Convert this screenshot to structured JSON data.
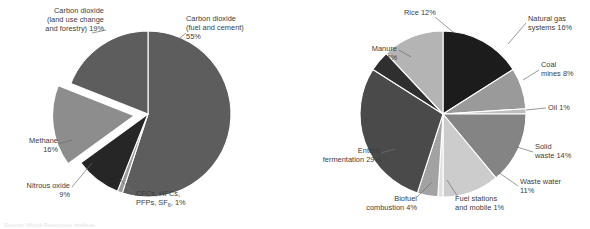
{
  "figure": {
    "background_color": "#ffffff",
    "text_color": "#3c3c3c",
    "leader_line_color": "#6e6e6e",
    "slice_gap_color": "#ffffff",
    "caption_fragment": "Source: World Resources Institute"
  },
  "chart_data": [
    {
      "type": "pie",
      "title": "",
      "id": "global-greenhouse-gas-emissions",
      "categories": [
        "Carbon dioxide (fuel and cement)",
        "CFCs, HFCs, PFPs, SF6",
        "Nitrous oxide",
        "Methane",
        "Carbon dioxide (land use change and forestry)"
      ],
      "values": [
        55,
        1,
        9,
        16,
        19
      ],
      "units": "percent",
      "legend": "none",
      "start_angle_deg": 0,
      "exploded_slices": [
        "Methane"
      ],
      "slices": [
        {
          "name": "Carbon dioxide (fuel and cement)",
          "label": "Carbon dioxide\n(fuel and cement)\n55%",
          "value": 55,
          "color": "#5d5d5d",
          "exploded": false
        },
        {
          "name": "CFCs, HFCs, PFPs, SF6",
          "label": "CFCs, HFCs,\nPFPs, SF6, 1%",
          "value": 1,
          "color": "#9b9b9b",
          "exploded": false
        },
        {
          "name": "Nitrous oxide",
          "label": "Nitrous oxide\n9%",
          "value": 9,
          "color": "#262626",
          "exploded": false
        },
        {
          "name": "Methane",
          "label": "Methane\n16%",
          "value": 16,
          "color": "#8d8d8d",
          "exploded": true
        },
        {
          "name": "Carbon dioxide (land use change and forestry)",
          "label": "Carbon dioxide\n(land use change\nand forestry) 19%",
          "value": 19,
          "color": "#5d5d5d",
          "exploded": false
        }
      ]
    },
    {
      "type": "pie",
      "title": "",
      "id": "methane-emissions-by-source",
      "categories": [
        "Natural gas systems",
        "Coal mines",
        "Oil",
        "Solid waste",
        "Waste water",
        "Fuel stations and mobile",
        "Biofuel combustion",
        "Enteric fermentation",
        "Manure",
        "Rice"
      ],
      "values": [
        16,
        8,
        1,
        14,
        11,
        1,
        4,
        29,
        4,
        12
      ],
      "units": "percent",
      "legend": "none",
      "start_angle_deg": 0,
      "exploded_slices": [],
      "slices": [
        {
          "name": "Natural gas systems",
          "label": "Natural gas\nsystems 16%",
          "value": 16,
          "color": "#1c1c1c",
          "exploded": false
        },
        {
          "name": "Coal mines",
          "label": "Coal\nmines 8%",
          "value": 8,
          "color": "#9a9a9a",
          "exploded": false
        },
        {
          "name": "Oil",
          "label": "Oil 1%",
          "value": 1,
          "color": "#bdbdbd",
          "exploded": false
        },
        {
          "name": "Solid waste",
          "label": "Solid\nwaste 14%",
          "value": 14,
          "color": "#848484",
          "exploded": false
        },
        {
          "name": "Waste water",
          "label": "Waste water\n11%",
          "value": 11,
          "color": "#cccccc",
          "exploded": false
        },
        {
          "name": "Fuel stations and mobile",
          "label": "Fuel stations\nand mobile 1%",
          "value": 1,
          "color": "#e0e0e0",
          "exploded": false
        },
        {
          "name": "Biofuel combustion",
          "label": "Biofuel\ncombustion 4%",
          "value": 4,
          "color": "#a2a2a2",
          "exploded": false
        },
        {
          "name": "Enteric fermentation",
          "label": "Enteric\nfermentation 29%",
          "value": 29,
          "color": "#4a4a4a",
          "exploded": false
        },
        {
          "name": "Manure",
          "label": "Manure\n4%",
          "value": 4,
          "color": "#2f2f2f",
          "exploded": false
        },
        {
          "name": "Rice",
          "label": "Rice 12%",
          "value": 12,
          "color": "#b4b4b4",
          "exploded": false
        }
      ]
    }
  ],
  "left_chart": {
    "labels": {
      "co2_land_use": "Carbon dioxide\n(land use change\nand forestry) 19%",
      "co2_fuel_cement": "Carbon dioxide\n(fuel and cement)\n55%",
      "methane": "Methane\n16%",
      "nitrous_oxide": "Nitrous oxide\n9%",
      "fgases_line1": "CFCs, HFCs,",
      "fgases_line2_a": "PFPs, SF",
      "fgases_sub": "6",
      "fgases_line2_b": ", 1%"
    }
  },
  "right_chart": {
    "labels": {
      "natural_gas": "Natural gas\nsystems 16%",
      "coal_mines": "Coal\nmines 8%",
      "oil": "Oil 1%",
      "solid_waste": "Solid\nwaste 14%",
      "waste_water": "Waste water\n11%",
      "fuel_stations": "Fuel stations\nand mobile 1%",
      "biofuel": "Biofuel\ncombustion 4%",
      "enteric": "Enteric\nfermentation 29%",
      "manure": "Manure\n4%",
      "rice": "Rice 12%"
    }
  }
}
